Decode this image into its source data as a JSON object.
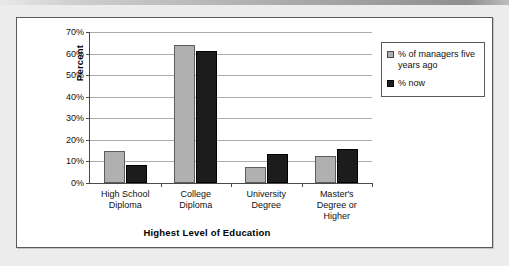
{
  "chart_data": {
    "type": "bar",
    "title": "",
    "xlabel": "Highest Level of Education",
    "ylabel": "Percent",
    "ylim": [
      0,
      70
    ],
    "ytick_labels": [
      "0%",
      "10%",
      "20%",
      "30%",
      "40%",
      "50%",
      "60%",
      "70%"
    ],
    "ytick_values": [
      0,
      10,
      20,
      30,
      40,
      50,
      60,
      70
    ],
    "grid": "horizontal",
    "legend_position": "right",
    "categories": [
      "High School Diploma",
      "College Diploma",
      "University Degree",
      "Master's Degree or Higher"
    ],
    "category_lines": [
      [
        "High School",
        "Diploma"
      ],
      [
        "College",
        "Diploma"
      ],
      [
        "University",
        "Degree"
      ],
      [
        "Master's",
        "Degree or",
        "Higher"
      ]
    ],
    "series": [
      {
        "name": "% of managers five years ago",
        "color": "#b0b0b0",
        "values": [
          15,
          64,
          7.5,
          12.7
        ]
      },
      {
        "name": "% now",
        "color": "#1c1c1c",
        "values": [
          8.5,
          61,
          13.5,
          16
        ]
      }
    ]
  },
  "legend": {
    "items": [
      {
        "label": "% of managers five years ago",
        "swatch": "gray-swatch"
      },
      {
        "label": "% now",
        "swatch": "black-swatch"
      }
    ]
  }
}
